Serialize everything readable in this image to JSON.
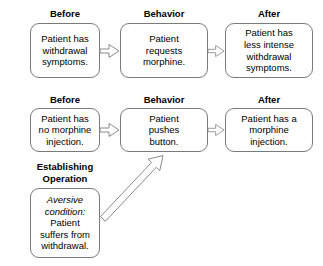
{
  "diagram": {
    "background_color": "#ffffff",
    "box_border_color": "#7a7a7a",
    "arrow_color": "#8a8a8a",
    "text_color": "#000000",
    "rows": [
      {
        "id": "row-1",
        "labels": {
          "before": "Before",
          "behavior": "Behavior",
          "after": "After"
        },
        "boxes": {
          "before": "Patient has\nwithdrawal\nsymptoms.",
          "behavior": "Patient\nrequests\nmorphine.",
          "after": "Patient has\nless intense\nwithdrawal\nsymptoms."
        }
      },
      {
        "id": "row-2",
        "labels": {
          "before": "Before",
          "behavior": "Behavior",
          "after": "After"
        },
        "boxes": {
          "before": "Patient has\nno morphine\ninjection.",
          "behavior": "Patient\npushes\nbutton.",
          "after": "Patient has a\nmorphine\ninjection."
        }
      }
    ],
    "establishing_operation": {
      "label": "Establishing\nOperation",
      "italic_text": "Aversive\ncondition:",
      "body_text": "Patient\nsuffers from\nwithdrawal."
    },
    "arrows": [
      {
        "name": "arrow-row1-before-to-behavior",
        "kind": "block-arrow-right"
      },
      {
        "name": "arrow-row1-behavior-to-after",
        "kind": "block-arrow-right"
      },
      {
        "name": "arrow-row2-before-to-behavior",
        "kind": "block-arrow-right"
      },
      {
        "name": "arrow-row2-behavior-to-after",
        "kind": "block-arrow-right"
      },
      {
        "name": "arrow-eo-to-behavior",
        "kind": "block-arrow-diagonal-up-right"
      }
    ]
  }
}
